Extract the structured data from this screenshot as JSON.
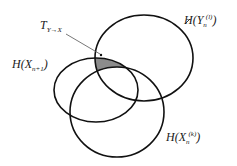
{
  "diagram": {
    "type": "venn",
    "title": "",
    "sets": [
      {
        "id": "Y",
        "label_main": "H(Y",
        "label_sub": "n",
        "label_sup": "(l)",
        "label_close": ")"
      },
      {
        "id": "X_next",
        "label_main": "H(X",
        "label_sub": "n+1",
        "label_close": ")"
      },
      {
        "id": "X_past",
        "label_main": "H(X",
        "label_sub": "n",
        "label_sup": "(k)",
        "label_close": ")"
      }
    ],
    "highlight": {
      "label_main": "T",
      "label_sub": "Y→X",
      "description": "Region inside H(Y_n^(l)) and H(X_{n+1}) but outside H(X_n^(k))"
    },
    "colors": {
      "stroke": "#111111",
      "shaded": "#8c8c8c",
      "background": "#ffffff"
    }
  }
}
